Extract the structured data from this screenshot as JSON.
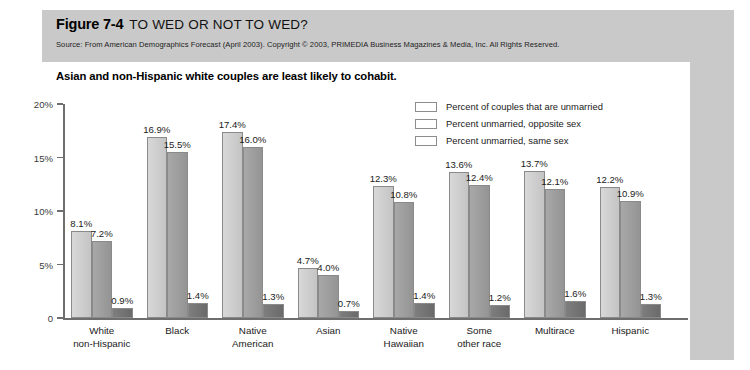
{
  "figure": {
    "number": "Figure 7-4",
    "title": "TO WED OR NOT TO WED?",
    "source": "Source: From American Demographics Forecast (April 2003). Copyright © 2003, PRIMEDIA Business Magazines & Media, Inc. All Rights Reserved.",
    "subtitle": "Asian and non-Hispanic white couples are least likely to cohabit."
  },
  "colors": {
    "series_unmarried_couples": "#cccccc",
    "series_opposite_sex": "#9c9c9c",
    "series_same_sex": "#747474",
    "band": "#c9c9c9",
    "axis": "#6e6e6e"
  },
  "chart_data": {
    "type": "bar",
    "title": "TO WED OR NOT TO WED?",
    "subtitle": "Asian and non-Hispanic white couples are least likely to cohabit.",
    "xlabel": "",
    "ylabel": "",
    "ylim": [
      0,
      20
    ],
    "grid": false,
    "legend_position": "top-right",
    "ytick_labels": [
      "0",
      "5%",
      "10%",
      "15%",
      "20%"
    ],
    "ytick_values": [
      0,
      5,
      10,
      15,
      20
    ],
    "categories": [
      "White\nnon-Hispanic",
      "Black",
      "Native\nAmerican",
      "Asian",
      "Native\nHawaiian",
      "Some\nother race",
      "Multirace",
      "Hispanic"
    ],
    "category_lines": [
      [
        "White",
        "non-Hispanic"
      ],
      [
        "Black",
        ""
      ],
      [
        "Native",
        "American"
      ],
      [
        "Asian",
        ""
      ],
      [
        "Native",
        "Hawaiian"
      ],
      [
        "Some",
        "other race"
      ],
      [
        "Multirace",
        ""
      ],
      [
        "Hispanic",
        ""
      ]
    ],
    "series": [
      {
        "name": "Percent of couples that are unmarried",
        "color": "#cccccc",
        "values": [
          8.1,
          16.9,
          17.4,
          4.7,
          12.3,
          13.6,
          13.7,
          12.2
        ],
        "labels": [
          "8.1%",
          "16.9%",
          "17.4%",
          "4.7%",
          "12.3%",
          "13.6%",
          "13.7%",
          "12.2%"
        ]
      },
      {
        "name": "Percent unmarried, opposite sex",
        "color": "#9c9c9c",
        "values": [
          7.2,
          15.5,
          16.0,
          4.0,
          10.8,
          12.4,
          12.1,
          10.9
        ],
        "labels": [
          "7.2%",
          "15.5%",
          "16.0%",
          "4.0%",
          "10.8%",
          "12.4%",
          "12.1%",
          "10.9%"
        ]
      },
      {
        "name": "Percent unmarried, same sex",
        "color": "#747474",
        "values": [
          0.9,
          1.4,
          1.3,
          0.7,
          1.4,
          1.2,
          1.6,
          1.3
        ],
        "labels": [
          "0.9%",
          "1.4%",
          "1.3%",
          "0.7%",
          "1.4%",
          "1.2%",
          "1.6%",
          "1.3%"
        ]
      }
    ]
  }
}
